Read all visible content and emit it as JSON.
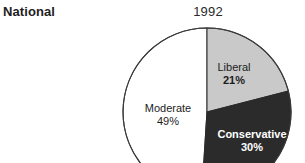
{
  "panel": {
    "label": "National"
  },
  "chart_data": {
    "type": "pie",
    "title": "1992",
    "xlabel": "",
    "ylabel": "",
    "legend": "none",
    "grid": false,
    "start_angle_deg": 90,
    "direction": "clockwise",
    "categories": [
      "Liberal",
      "Conservative",
      "Moderate"
    ],
    "values": [
      21,
      30,
      49
    ],
    "units": "percent",
    "slices": [
      {
        "name": "Liberal",
        "value": 21,
        "value_label": "21%",
        "color": "#c9c9c9",
        "text_color": "#1c1c1c"
      },
      {
        "name": "Conservative",
        "value": 30,
        "value_label": "30%",
        "color": "#2b2b2b",
        "text_color": "#ffffff"
      },
      {
        "name": "Moderate",
        "value": 49,
        "value_label": "49%",
        "color": "#ffffff",
        "text_color": "#1c1c1c"
      }
    ]
  },
  "colors": {
    "background": "#ffffff",
    "outline": "#3a3a3a",
    "liberal": "#c9c9c9",
    "conservative": "#2b2b2b",
    "moderate": "#ffffff",
    "text": "#1c1c1c"
  }
}
